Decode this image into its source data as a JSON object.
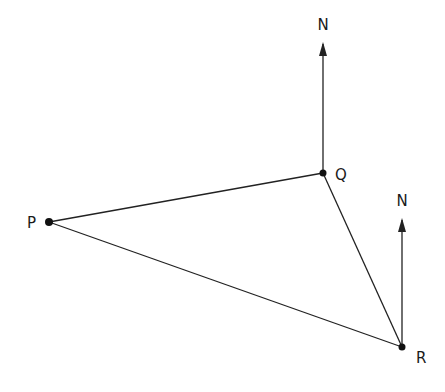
{
  "diagram": {
    "title": "",
    "points": [
      {
        "id": "P",
        "label": "P",
        "x": 49,
        "y": 222
      },
      {
        "id": "Q",
        "label": "Q",
        "x": 323,
        "y": 173
      },
      {
        "id": "R",
        "label": "R",
        "x": 402,
        "y": 347
      }
    ],
    "edges": [
      [
        "P",
        "Q"
      ],
      [
        "Q",
        "R"
      ],
      [
        "P",
        "R"
      ]
    ],
    "north_arrows": [
      {
        "at": "Q",
        "label": "N"
      },
      {
        "at": "R",
        "label": "N"
      }
    ],
    "colors": {
      "line": "#222222",
      "text": "#1a1a1a"
    }
  }
}
